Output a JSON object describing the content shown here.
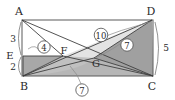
{
  "figure": {
    "type": "geometry-diagram",
    "shape": "rectangle",
    "vertices": {
      "A": {
        "label": "A",
        "x": 22,
        "y": 20
      },
      "B": {
        "label": "B",
        "x": 23,
        "y": 76
      },
      "C": {
        "label": "C",
        "x": 153,
        "y": 76
      },
      "D": {
        "label": "D",
        "x": 152,
        "y": 20
      }
    },
    "interior_points": {
      "E": {
        "label": "E",
        "x": 23,
        "y": 56
      },
      "F": {
        "label": "F",
        "x": 63,
        "y": 56
      },
      "G": {
        "label": "G",
        "x": 94,
        "y": 58
      }
    },
    "edge_lengths": [
      {
        "name": "AE",
        "label": "3",
        "x": 13,
        "y": 39
      },
      {
        "name": "EB",
        "label": "2",
        "x": 13,
        "y": 66
      },
      {
        "name": "DC",
        "label": "5",
        "x": 166,
        "y": 48
      }
    ],
    "area_labels": [
      {
        "name": "region-EBF",
        "label": "4",
        "x": 44,
        "y": 47,
        "circled": true
      },
      {
        "name": "region-AFGD",
        "label": "10",
        "x": 100,
        "y": 35,
        "circled": true
      },
      {
        "name": "region-GDC",
        "label": "7",
        "x": 127,
        "y": 45,
        "circled": true
      },
      {
        "name": "region-BGC",
        "label": "7",
        "x": 82,
        "y": 91,
        "circled": true
      }
    ],
    "colors": {
      "outline": "#4a4a4a",
      "shade_light": "#c9c9c9",
      "shade_mid": "#a8a8a8",
      "shade_dark": "#9a9a9a",
      "background": "#ffffff",
      "label_text": "#2b2b2b"
    }
  }
}
